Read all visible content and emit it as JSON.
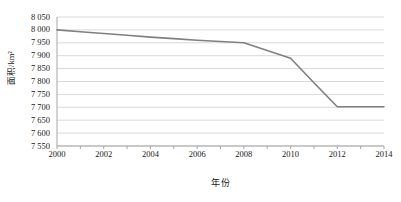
{
  "chart_data": {
    "type": "line",
    "title": "",
    "xlabel": "年份",
    "ylabel": "面积/km²",
    "x": [
      2000,
      2001,
      2002,
      2003,
      2004,
      2005,
      2006,
      2007,
      2008,
      2009,
      2010,
      2011,
      2012,
      2013,
      2014
    ],
    "values": [
      8000,
      7993,
      7986,
      7979,
      7972,
      7966,
      7960,
      7955,
      7950,
      7920,
      7890,
      7795,
      7702,
      7702,
      7702
    ],
    "series": [
      {
        "name": "面积",
        "color": "#808080",
        "values": [
          8000,
          7993,
          7986,
          7979,
          7972,
          7966,
          7960,
          7955,
          7950,
          7920,
          7890,
          7795,
          7702,
          7702,
          7702
        ]
      }
    ],
    "xlim": [
      2000,
      2014
    ],
    "ylim": [
      7550,
      8050
    ],
    "ytick_step": 50,
    "xtick_step": 2,
    "ytick_labels": [
      "8 050",
      "8 000",
      "7 950",
      "7 900",
      "7 850",
      "7 800",
      "7 750",
      "7 700",
      "7 650",
      "7 600",
      "7 550"
    ],
    "ytick_values": [
      8050,
      8000,
      7950,
      7900,
      7850,
      7800,
      7750,
      7700,
      7650,
      7600,
      7550
    ],
    "xtick_labels": [
      "2000",
      "2002",
      "2004",
      "2006",
      "2008",
      "2010",
      "2012",
      "2014"
    ],
    "xtick_values": [
      2000,
      2002,
      2004,
      2006,
      2008,
      2010,
      2012,
      2014
    ],
    "x_minor_ticks": [
      2000,
      2001,
      2002,
      2003,
      2004,
      2005,
      2006,
      2007,
      2008,
      2009,
      2010,
      2011,
      2012,
      2013,
      2014
    ],
    "grid": {
      "horizontal": true,
      "vertical": false,
      "color": "#d9d9d9"
    },
    "legend": {
      "visible": false,
      "position": "none"
    },
    "axis_color": "#a6a6a6",
    "background": "#ffffff"
  }
}
